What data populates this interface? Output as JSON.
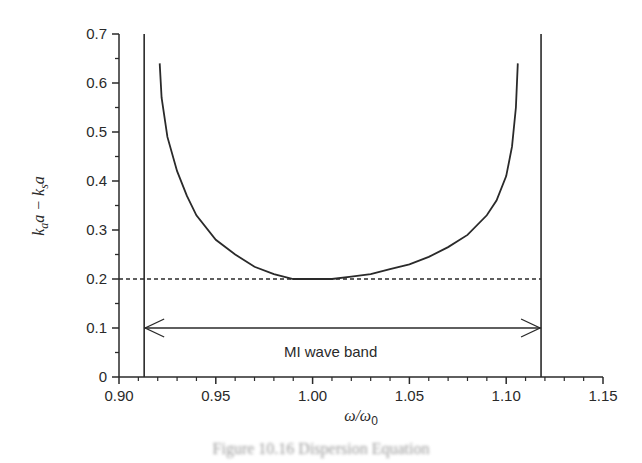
{
  "chart_data": {
    "type": "line",
    "title": "",
    "xlabel": "ω/ω0",
    "ylabel": "k_a a − k_s a",
    "xlim": [
      0.9,
      1.15
    ],
    "ylim": [
      0,
      0.7
    ],
    "x_ticks": [
      "0.90",
      "0.95",
      "1.00",
      "1.05",
      "1.10",
      "1.15"
    ],
    "y_ticks": [
      "0",
      "0.1",
      "0.2",
      "0.3",
      "0.4",
      "0.5",
      "0.6",
      "0.7"
    ],
    "grid": false,
    "legend": null,
    "series": [
      {
        "name": "k_a a − k_s a",
        "style": "solid",
        "x": [
          0.921,
          0.922,
          0.925,
          0.93,
          0.935,
          0.94,
          0.95,
          0.96,
          0.97,
          0.98,
          0.99,
          1.0,
          1.01,
          1.02,
          1.03,
          1.04,
          1.05,
          1.06,
          1.07,
          1.08,
          1.09,
          1.095,
          1.1,
          1.103,
          1.105,
          1.106
        ],
        "y": [
          0.64,
          0.57,
          0.49,
          0.42,
          0.37,
          0.33,
          0.28,
          0.25,
          0.225,
          0.21,
          0.2,
          0.2,
          0.2,
          0.205,
          0.21,
          0.22,
          0.23,
          0.245,
          0.265,
          0.29,
          0.33,
          0.36,
          0.41,
          0.47,
          0.55,
          0.64
        ]
      },
      {
        "name": "threshold",
        "style": "dashed",
        "x": [
          0.9,
          1.118
        ],
        "y": [
          0.2,
          0.2
        ]
      }
    ],
    "vertical_lines": [
      0.913,
      1.118
    ],
    "annotations": [
      {
        "text": "MI wave band",
        "type": "double-arrow",
        "x_from": 0.913,
        "x_to": 1.118,
        "y": 0.1
      }
    ]
  },
  "labels": {
    "xlabel_main": "ω/ω",
    "xlabel_sub": "0",
    "ylabel_part1": "k",
    "ylabel_sub1": "a",
    "ylabel_part2": "a − k",
    "ylabel_sub2": "s",
    "ylabel_part3": "a",
    "band_label": "MI wave band",
    "caption": "Figure 10.16  Dispersion Equation"
  }
}
